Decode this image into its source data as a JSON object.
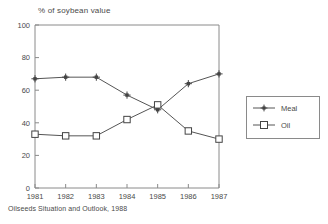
{
  "chart_data": {
    "type": "line",
    "title": "% of soybean value",
    "xlabel": "",
    "ylabel": "",
    "ylim": [
      0,
      100
    ],
    "yticks": [
      0,
      20,
      40,
      60,
      80,
      100
    ],
    "categories": [
      "1981",
      "1982",
      "1983",
      "1984",
      "1985",
      "1986",
      "1987"
    ],
    "x": [
      1981,
      1982,
      1983,
      1984,
      1985,
      1986,
      1987
    ],
    "grid": false,
    "legend_position": "right",
    "series": [
      {
        "name": "Meal",
        "marker": "star",
        "values": [
          67,
          68,
          68,
          57,
          48,
          64,
          70
        ]
      },
      {
        "name": "Oil",
        "marker": "open-square",
        "values": [
          33,
          32,
          32,
          42,
          51,
          35,
          30
        ]
      }
    ],
    "source_note": "Oilseeds Situation and Outlook, 1988"
  },
  "legend": {
    "entries": [
      {
        "label": "Meal"
      },
      {
        "label": "Oil"
      }
    ]
  },
  "colors": {
    "line": "#555555",
    "axis": "#7a7a7a",
    "text": "#4a4a4a",
    "background": "#ffffff"
  }
}
